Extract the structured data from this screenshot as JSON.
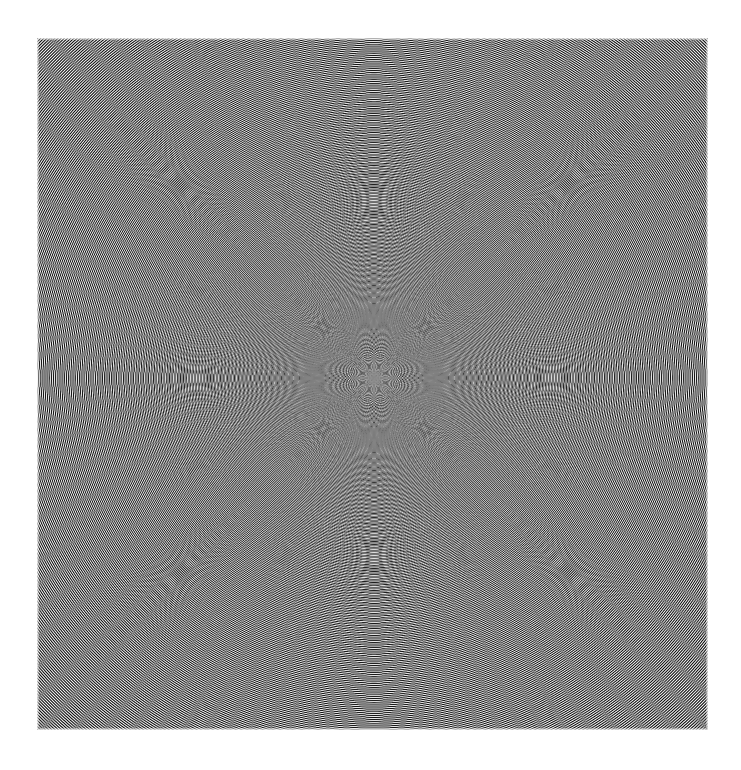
{
  "image": {
    "title": "Radial interference moire pattern",
    "alt_text": "Grayscale circular interference pattern of concentric rings crossed by radial spokes, forming lens shaped black and white blobs that shrink toward a gray blurred center",
    "canvas_width": 741,
    "canvas_height": 770,
    "background_color": "#ffffff"
  },
  "pattern": {
    "name": "radial-moire-pattern",
    "left": 36,
    "top": 37,
    "width": 673,
    "height": 694,
    "center_x": 374,
    "center_y": 378,
    "angular_spokes": 60,
    "radial_scale": 7.7,
    "radial_exponent": 0.62,
    "radial_phase": 0.0,
    "angular_phase": 0.08,
    "contrast_gamma": 0.42,
    "center_blur_radius": 26,
    "center_gray": "#8c8c8c",
    "dark_color": "#000000",
    "light_color": "#ffffff",
    "edge_fade": 3,
    "speckle_count": 150,
    "speckle_color": "#ffffff",
    "speckle_seed": 20240517
  }
}
